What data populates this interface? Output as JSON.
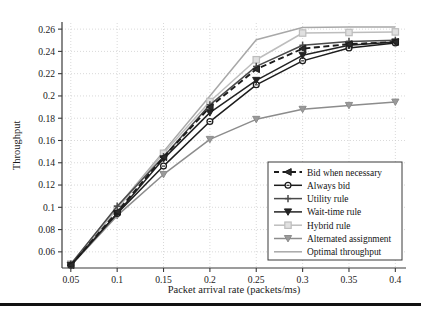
{
  "figure": {
    "background_color": "#ffffff",
    "bottom_rule_color": "#111111"
  },
  "chart_data": {
    "type": "line",
    "title": "",
    "xlabel": "Packet arrival rate (packets/ms)",
    "ylabel": "Throughput",
    "x": [
      0.05,
      0.1,
      0.15,
      0.2,
      0.25,
      0.3,
      0.35,
      0.4
    ],
    "xticks": [
      "0.05",
      "0.1",
      "0.15",
      "0.2",
      "0.25",
      "0.3",
      "0.35",
      "0.4"
    ],
    "yticks": [
      "0.06",
      "0.08",
      "0.1",
      "0.12",
      "0.14",
      "0.16",
      "0.18",
      "0.2",
      "0.22",
      "0.24",
      "0.26"
    ],
    "ytick_values": [
      0.06,
      0.08,
      0.1,
      0.12,
      0.14,
      0.16,
      0.18,
      0.2,
      0.22,
      0.24,
      0.26
    ],
    "xlim": [
      0.0405,
      0.4115
    ],
    "ylim": [
      0.0455,
      0.2655
    ],
    "grid": true,
    "grid_style": "dotted",
    "grid_color": "#c9c9c9",
    "legend_position": "lower-right",
    "series": [
      {
        "name": "Bid when necessary",
        "color": "#1c1c1c",
        "line_style": "dashed",
        "marker": "left-triangle",
        "marker_fill": "#2b2b2b",
        "values": [
          0.048,
          0.096,
          0.145,
          0.19,
          0.224,
          0.2425,
          0.2465,
          0.2485
        ]
      },
      {
        "name": "Always bid",
        "color": "#1c1c1c",
        "line_style": "solid",
        "marker": "circle",
        "marker_fill": "#ffffff",
        "values": [
          0.048,
          0.0945,
          0.137,
          0.177,
          0.21,
          0.2315,
          0.243,
          0.2475
        ]
      },
      {
        "name": "Utility rule",
        "color": "#4a4a4a",
        "line_style": "solid",
        "marker": "plus",
        "marker_fill": "#4a4a4a",
        "values": [
          0.049,
          0.101,
          0.1455,
          0.192,
          0.2265,
          0.2455,
          0.249,
          0.25
        ]
      },
      {
        "name": "Wait-time rule",
        "color": "#232323",
        "line_style": "solid",
        "marker": "down-triangle",
        "marker_fill": "#232323",
        "values": [
          0.048,
          0.0945,
          0.1435,
          0.185,
          0.214,
          0.2365,
          0.2455,
          0.2485
        ]
      },
      {
        "name": "Hybrid rule",
        "color": "#bdbdbd",
        "line_style": "solid",
        "marker": "square",
        "marker_fill": "#e0e0e0",
        "values": [
          0.049,
          0.0985,
          0.1485,
          0.195,
          0.2325,
          0.2565,
          0.257,
          0.2575
        ]
      },
      {
        "name": "Alternated assignment",
        "color": "#8c8c8c",
        "line_style": "solid",
        "marker": "down-triangle",
        "marker_fill": "#9a9a9a",
        "values": [
          0.0475,
          0.0925,
          0.1295,
          0.161,
          0.179,
          0.188,
          0.1915,
          0.1945
        ]
      },
      {
        "name": "Optimal throughput",
        "color": "#a8a8a8",
        "line_style": "solid",
        "marker": "none",
        "marker_fill": "#a8a8a8",
        "values": [
          0.049,
          0.1,
          0.15,
          0.2,
          0.2505,
          0.2615,
          0.262,
          0.262
        ]
      }
    ]
  }
}
